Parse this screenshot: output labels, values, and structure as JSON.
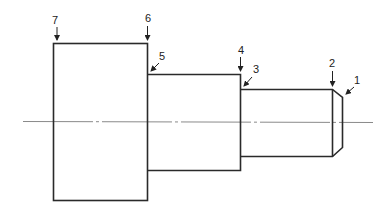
{
  "diagram": {
    "colors": {
      "outline": "#2a2a2a",
      "centerline": "#8a8a8a",
      "text": "#222222"
    },
    "labels": [
      {
        "id": "1",
        "text": "1",
        "target": "chamfer end face"
      },
      {
        "id": "2",
        "text": "2",
        "target": "chamfer start"
      },
      {
        "id": "3",
        "text": "3",
        "target": "small diameter shoulder"
      },
      {
        "id": "4",
        "text": "4",
        "target": "middle diameter end face"
      },
      {
        "id": "5",
        "text": "5",
        "target": "middle diameter shoulder"
      },
      {
        "id": "6",
        "text": "6",
        "target": "large diameter end face"
      },
      {
        "id": "7",
        "text": "7",
        "target": "large diameter left face"
      }
    ]
  }
}
